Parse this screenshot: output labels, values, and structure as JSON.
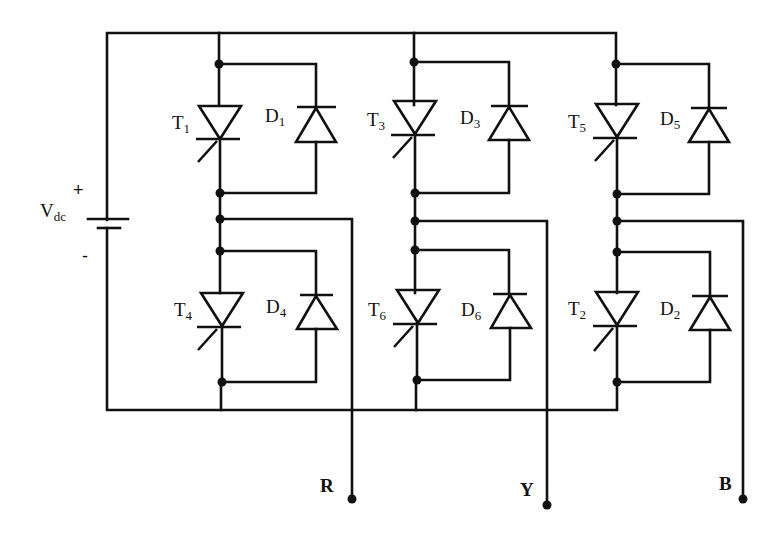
{
  "diagram": {
    "source": {
      "label_main": "V",
      "label_sub": "dc",
      "plus": "+",
      "minus": "-"
    },
    "legs": [
      {
        "upper": {
          "thyristor_main": "T",
          "thyristor_sub": "1",
          "diode_main": "D",
          "diode_sub": "1"
        },
        "lower": {
          "thyristor_main": "T",
          "thyristor_sub": "4",
          "diode_main": "D",
          "diode_sub": "4"
        },
        "output": "R"
      },
      {
        "upper": {
          "thyristor_main": "T",
          "thyristor_sub": "3",
          "diode_main": "D",
          "diode_sub": "3"
        },
        "lower": {
          "thyristor_main": "T",
          "thyristor_sub": "6",
          "diode_main": "D",
          "diode_sub": "6"
        },
        "output": "Y"
      },
      {
        "upper": {
          "thyristor_main": "T",
          "thyristor_sub": "5",
          "diode_main": "D",
          "diode_sub": "5"
        },
        "lower": {
          "thyristor_main": "T",
          "thyristor_sub": "2",
          "diode_main": "D",
          "diode_sub": "2"
        },
        "output": "B"
      }
    ],
    "colors": {
      "line": "#111111",
      "background": "#ffffff"
    }
  }
}
